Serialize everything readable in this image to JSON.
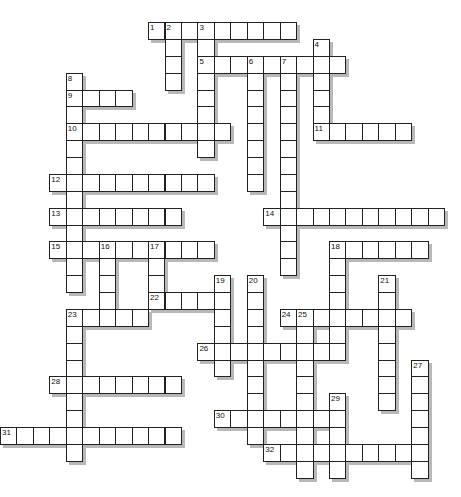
{
  "puzzle": {
    "type": "crossword",
    "cell_width": 16.45,
    "cell_height": 16.88,
    "origin_x": 0,
    "origin_y": 22,
    "colors": {
      "border": "#222222",
      "fill": "#ffffff",
      "shadow": "#b8b8b8",
      "number": "#111111"
    },
    "words": [
      {
        "num": 1,
        "dir": "across",
        "row": 0,
        "col": 9,
        "len": 9
      },
      {
        "num": 2,
        "dir": "down",
        "row": 0,
        "col": 10,
        "len": 4
      },
      {
        "num": 3,
        "dir": "down",
        "row": 0,
        "col": 12,
        "len": 8
      },
      {
        "num": 4,
        "dir": "down",
        "row": 1,
        "col": 19,
        "len": 6
      },
      {
        "num": 5,
        "dir": "across",
        "row": 2,
        "col": 12,
        "len": 9
      },
      {
        "num": 6,
        "dir": "down",
        "row": 2,
        "col": 15,
        "len": 8
      },
      {
        "num": 7,
        "dir": "down",
        "row": 2,
        "col": 17,
        "len": 13
      },
      {
        "num": 8,
        "dir": "down",
        "row": 3,
        "col": 4,
        "len": 13
      },
      {
        "num": 9,
        "dir": "across",
        "row": 4,
        "col": 4,
        "len": 4
      },
      {
        "num": 10,
        "dir": "across",
        "row": 6,
        "col": 4,
        "len": 10
      },
      {
        "num": 11,
        "dir": "across",
        "row": 6,
        "col": 19,
        "len": 6
      },
      {
        "num": 12,
        "dir": "across",
        "row": 9,
        "col": 3,
        "len": 10
      },
      {
        "num": 13,
        "dir": "across",
        "row": 11,
        "col": 3,
        "len": 8
      },
      {
        "num": 14,
        "dir": "across",
        "row": 11,
        "col": 16,
        "len": 11
      },
      {
        "num": 15,
        "dir": "across",
        "row": 13,
        "col": 3,
        "len": 10
      },
      {
        "num": 16,
        "dir": "down",
        "row": 13,
        "col": 6,
        "len": 5
      },
      {
        "num": 17,
        "dir": "down",
        "row": 13,
        "col": 9,
        "len": 4
      },
      {
        "num": 18,
        "dir": "across",
        "row": 13,
        "col": 20,
        "len": 6
      },
      {
        "num": 18,
        "dir": "down",
        "row": 13,
        "col": 20,
        "len": 7
      },
      {
        "num": 19,
        "dir": "down",
        "row": 15,
        "col": 13,
        "len": 6
      },
      {
        "num": 20,
        "dir": "down",
        "row": 15,
        "col": 15,
        "len": 10
      },
      {
        "num": 21,
        "dir": "down",
        "row": 15,
        "col": 23,
        "len": 8
      },
      {
        "num": 22,
        "dir": "across",
        "row": 16,
        "col": 9,
        "len": 5
      },
      {
        "num": 23,
        "dir": "across",
        "row": 17,
        "col": 4,
        "len": 5
      },
      {
        "num": 23,
        "dir": "down",
        "row": 17,
        "col": 4,
        "len": 9
      },
      {
        "num": 24,
        "dir": "across",
        "row": 17,
        "col": 17,
        "len": 8
      },
      {
        "num": 25,
        "dir": "down",
        "row": 17,
        "col": 18,
        "len": 10
      },
      {
        "num": 26,
        "dir": "across",
        "row": 19,
        "col": 12,
        "len": 9
      },
      {
        "num": 27,
        "dir": "down",
        "row": 20,
        "col": 25,
        "len": 7
      },
      {
        "num": 28,
        "dir": "across",
        "row": 21,
        "col": 3,
        "len": 8
      },
      {
        "num": 29,
        "dir": "down",
        "row": 22,
        "col": 20,
        "len": 5
      },
      {
        "num": 30,
        "dir": "across",
        "row": 23,
        "col": 13,
        "len": 8
      },
      {
        "num": 31,
        "dir": "across",
        "row": 24,
        "col": 0,
        "len": 11
      },
      {
        "num": 32,
        "dir": "across",
        "row": 25,
        "col": 16,
        "len": 10
      }
    ]
  }
}
